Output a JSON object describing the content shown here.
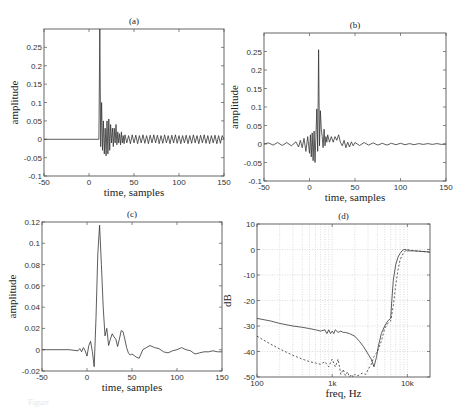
{
  "chart_data": [
    {
      "id": "a",
      "type": "line",
      "title": "(a)",
      "xlabel": "time, samples",
      "ylabel": "amplitude",
      "xlim": [
        -50,
        150
      ],
      "ylim": [
        -0.1,
        0.3
      ],
      "xticks": [
        -50,
        0,
        50,
        100,
        150
      ],
      "yticks": [
        -0.1,
        -0.05,
        0,
        0.05,
        0.1,
        0.15,
        0.2,
        0.25
      ],
      "ytick_labels": [
        "-0.1",
        "-0.05",
        "0",
        "0.05",
        "0.1",
        "0.15",
        "0.2",
        "0.25"
      ],
      "xtick_labels": [
        "-50",
        "0",
        "50",
        "100",
        "150"
      ],
      "series": [
        {
          "name": "impulse response",
          "style": "solid",
          "x": [
            -50,
            11,
            12,
            13,
            14,
            15,
            16,
            17,
            18,
            19,
            20,
            21,
            22,
            23,
            24,
            25,
            26,
            27,
            28,
            29,
            30,
            31,
            32,
            33,
            34,
            35,
            36,
            37,
            38,
            39,
            40,
            42,
            44,
            46,
            48,
            50,
            52,
            54,
            56,
            58,
            60,
            62,
            64,
            66,
            68,
            70,
            72,
            74,
            76,
            78,
            80,
            82,
            84,
            86,
            88,
            90,
            92,
            94,
            96,
            98,
            100,
            102,
            104,
            106,
            108,
            110,
            112,
            114,
            116,
            118,
            120,
            122,
            124,
            126,
            128,
            130,
            132,
            134,
            136,
            138,
            140,
            142,
            144,
            146,
            148,
            150
          ],
          "y": [
            0,
            0,
            0.3,
            -0.02,
            0.1,
            -0.03,
            0.05,
            -0.04,
            0.03,
            -0.045,
            0.05,
            -0.04,
            0.055,
            -0.03,
            0.04,
            -0.01,
            0.03,
            -0.02,
            0.03,
            -0.01,
            0.04,
            -0.015,
            0.02,
            -0.01,
            0.015,
            -0.015,
            0.02,
            -0.01,
            0.01,
            -0.012,
            0.012,
            -0.01,
            0.01,
            -0.012,
            0.012,
            -0.01,
            0.011,
            -0.012,
            0.01,
            -0.01,
            0.012,
            -0.011,
            0.01,
            -0.012,
            0.011,
            -0.01,
            0.012,
            -0.01,
            0.011,
            -0.012,
            0.01,
            -0.011,
            0.012,
            -0.01,
            0.01,
            -0.012,
            0.011,
            -0.01,
            0.012,
            -0.011,
            0.01,
            -0.012,
            0.01,
            -0.01,
            0.011,
            -0.012,
            0.01,
            -0.011,
            0.012,
            -0.01,
            0.01,
            -0.012,
            0.011,
            -0.01,
            0.012,
            -0.011,
            0.01,
            -0.012,
            0.01,
            -0.01,
            0.011,
            -0.012,
            0.01,
            -0.011,
            0.01,
            0
          ]
        }
      ]
    },
    {
      "id": "b",
      "type": "line",
      "title": "(b)",
      "xlabel": "time, samples",
      "ylabel": "amplitude",
      "xlim": [
        -50,
        150
      ],
      "ylim": [
        -0.1,
        0.3
      ],
      "xticks": [
        -50,
        0,
        50,
        100,
        150
      ],
      "yticks": [
        -0.1,
        -0.05,
        0,
        0.05,
        0.1,
        0.15,
        0.2,
        0.25
      ],
      "ytick_labels": [
        "-0.1",
        "-0.05",
        "0",
        "0.05",
        "0.1",
        "0.15",
        "0.2",
        "0.25"
      ],
      "xtick_labels": [
        "-50",
        "0",
        "50",
        "100",
        "150"
      ],
      "series": [
        {
          "name": "equalized response",
          "style": "solid",
          "x": [
            -50,
            -45,
            -40,
            -35,
            -30,
            -25,
            -20,
            -15,
            -12,
            -10,
            -8,
            -6,
            -4,
            -2,
            0,
            1,
            2,
            3,
            4,
            5,
            6,
            7,
            8,
            9,
            10,
            11,
            12,
            13,
            14,
            15,
            16,
            17,
            18,
            19,
            20,
            22,
            24,
            26,
            28,
            30,
            32,
            34,
            36,
            38,
            40,
            42,
            44,
            46,
            48,
            50,
            55,
            60,
            65,
            70,
            75,
            80,
            85,
            90,
            95,
            100,
            105,
            110,
            115,
            120,
            125,
            130,
            135,
            140,
            145,
            150
          ],
          "y": [
            0,
            0.003,
            -0.003,
            0.004,
            -0.004,
            0.004,
            -0.005,
            0.006,
            -0.008,
            0.01,
            -0.01,
            0.015,
            -0.02,
            0.02,
            -0.025,
            0.025,
            -0.035,
            0.03,
            -0.045,
            0.035,
            -0.05,
            0.02,
            0.095,
            -0.02,
            0.255,
            -0.005,
            0.09,
            0.04,
            0.02,
            -0.01,
            0.04,
            -0.005,
            0.02,
            0.005,
            0.025,
            0.005,
            0.02,
            0.005,
            0.02,
            0.01,
            0.025,
            0.005,
            -0.005,
            0.01,
            -0.01,
            0.005,
            -0.008,
            0.006,
            -0.005,
            0.004,
            -0.004,
            0.004,
            -0.003,
            0.003,
            -0.003,
            0.002,
            -0.003,
            0.002,
            -0.002,
            0.002,
            -0.002,
            0.001,
            -0.002,
            0.001,
            -0.001,
            0.001,
            -0.001,
            0.001,
            -0.001,
            0
          ]
        }
      ]
    },
    {
      "id": "c",
      "type": "line",
      "title": "(c)",
      "xlabel": "time, samples",
      "ylabel": "amplitude",
      "xlim": [
        -50,
        150
      ],
      "ylim": [
        -0.02,
        0.12
      ],
      "xticks": [
        -50,
        0,
        50,
        100,
        150
      ],
      "yticks": [
        -0.02,
        0,
        0.02,
        0.04,
        0.06,
        0.08,
        0.1,
        0.12
      ],
      "ytick_labels": [
        "-0.02",
        "0",
        "0.02",
        "0.04",
        "0.06",
        "0.08",
        "0.1",
        "0.12"
      ],
      "xtick_labels": [
        "-50",
        "0",
        "50",
        "100",
        "150"
      ],
      "series": [
        {
          "name": "response",
          "style": "solid",
          "x": [
            -50,
            -20,
            -10,
            -8,
            -6,
            -4,
            -2,
            0,
            2,
            4,
            6,
            8,
            10,
            12,
            14,
            16,
            18,
            20,
            22,
            24,
            26,
            28,
            30,
            32,
            34,
            36,
            38,
            40,
            42,
            44,
            46,
            48,
            50,
            55,
            58,
            62,
            66,
            70,
            75,
            80,
            85,
            90,
            95,
            100,
            105,
            110,
            115,
            120,
            125,
            130,
            135,
            140,
            145,
            150
          ],
          "y": [
            0,
            0,
            -0.001,
            0.001,
            -0.002,
            0.002,
            -0.001,
            -0.006,
            0.004,
            0.008,
            -0.002,
            -0.016,
            0.03,
            0.09,
            0.117,
            0.08,
            0.04,
            0.013,
            0.02,
            0.004,
            0.01,
            0.015,
            0.012,
            0.01,
            0.003,
            0.01,
            0.018,
            0.017,
            0.01,
            0.002,
            -0.003,
            -0.005,
            -0.004,
            -0.007,
            -0.008,
            0,
            0.002,
            0.004,
            0.002,
            0.001,
            -0.002,
            -0.003,
            -0.001,
            0,
            0.002,
            0,
            -0.001,
            -0.004,
            -0.003,
            -0.002,
            -0.002,
            -0.001,
            -0.002,
            -0.002
          ]
        }
      ]
    },
    {
      "id": "d",
      "type": "line",
      "title": "(d)",
      "xlabel": "freq, Hz",
      "ylabel": "dB",
      "xscale": "log",
      "xlim": [
        100,
        20000
      ],
      "ylim": [
        -50,
        10
      ],
      "xticks": [
        100,
        1000,
        10000
      ],
      "xtick_labels": [
        "100",
        "1k",
        "10k"
      ],
      "yticks": [
        -50,
        -40,
        -30,
        -20,
        -10,
        0,
        10
      ],
      "ytick_labels": [
        "-50",
        "-40",
        "-30",
        "-20",
        "-10",
        "0",
        "10"
      ],
      "grid": true,
      "series": [
        {
          "name": "solid",
          "style": "solid",
          "x": [
            100,
            150,
            200,
            300,
            400,
            500,
            600,
            700,
            800,
            850,
            900,
            950,
            1000,
            1050,
            1100,
            1200,
            1300,
            1400,
            1500,
            1700,
            2000,
            2300,
            2600,
            3000,
            3300,
            3600,
            3900,
            4100,
            4500,
            5000,
            5500,
            6000,
            6200,
            6500,
            7000,
            7500,
            8000,
            8500,
            9000,
            9500,
            10000,
            12000,
            15000,
            20000
          ],
          "y": [
            -27,
            -28,
            -29,
            -30,
            -30.5,
            -31,
            -31.5,
            -32,
            -31.5,
            -33,
            -31.5,
            -33,
            -32,
            -33,
            -31.5,
            -32.5,
            -32,
            -32.5,
            -32.5,
            -33,
            -34,
            -36,
            -38,
            -41,
            -43,
            -46,
            -42,
            -38,
            -33,
            -30,
            -28,
            -27,
            -20,
            -12,
            -6,
            -3,
            -1.5,
            -0.5,
            0,
            0,
            -0.5,
            -0.5,
            -0.7,
            -1
          ]
        },
        {
          "name": "dashed",
          "style": "dashed",
          "x": [
            100,
            150,
            200,
            300,
            400,
            500,
            600,
            700,
            800,
            900,
            1000,
            1100,
            1200,
            1300,
            1400,
            1500,
            1600,
            1700,
            1800,
            1900,
            2000,
            2200,
            2500,
            2800,
            3000,
            3300,
            3600,
            4000,
            4500,
            5000,
            5500,
            6000,
            6500,
            7000,
            7500,
            8000,
            9000,
            10000,
            12000,
            15000,
            20000
          ],
          "y": [
            -34,
            -37,
            -39,
            -41.5,
            -43,
            -44,
            -44.5,
            -45,
            -44,
            -46,
            -43,
            -46,
            -43,
            -49,
            -47,
            -49.5,
            -48,
            -50,
            -49,
            -50,
            -49,
            -49.5,
            -48.5,
            -49,
            -47,
            -45,
            -42,
            -40,
            -36,
            -31,
            -29,
            -28,
            -22,
            -14,
            -8,
            -4,
            -1,
            0,
            -0.5,
            -0.7,
            -1
          ]
        }
      ]
    }
  ],
  "caption": "Figure"
}
